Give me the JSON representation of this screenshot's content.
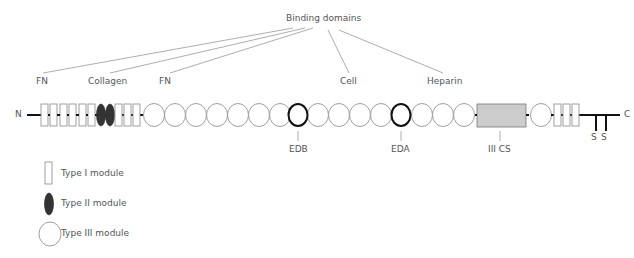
{
  "title": "Binding domains",
  "binding_labels": {
    "fn_left": "FN",
    "collagen": "Collagen",
    "fn_right": "FN",
    "cell": "Cell",
    "heparin": "Heparin"
  },
  "chain": {
    "n_terminus": "N",
    "c_terminus": "C",
    "disulfide_labels": [
      "S",
      "S"
    ],
    "modules_in_order": [
      "I",
      "I",
      "I",
      "I",
      "I",
      "I",
      "II",
      "II",
      "I",
      "I",
      "I",
      "III",
      "III",
      "III",
      "III",
      "III",
      "III",
      "III",
      "EDB",
      "III",
      "III",
      "III",
      "III",
      "EDA",
      "III",
      "III",
      "III",
      "IIICS",
      "III",
      "I",
      "I",
      "I"
    ]
  },
  "splice_labels": {
    "edb": "EDB",
    "eda": "EDA",
    "iiics": "III CS"
  },
  "legend": [
    {
      "shape": "rect",
      "label": "Type I module"
    },
    {
      "shape": "filled-ellipse",
      "label": "Type II module"
    },
    {
      "shape": "circle",
      "label": "Type III module"
    }
  ],
  "colors": {
    "stroke": "#888888",
    "bold_stroke": "#111111",
    "type2_fill": "#333333",
    "iiics_fill": "#cccccc",
    "text": "#555555"
  }
}
